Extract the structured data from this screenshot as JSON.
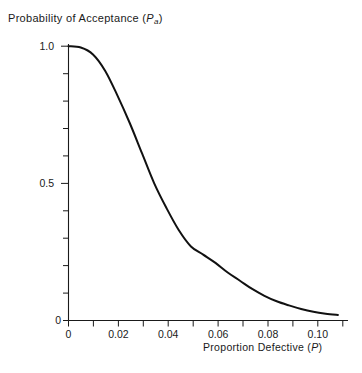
{
  "chart_data": {
    "type": "line",
    "title": "Probability of Acceptance (Pa)",
    "title_main": "Probability  of  Acceptance  (",
    "title_var": "P",
    "title_sub": "a",
    "title_close": ")",
    "xlabel": "Proportion  Defective  (P)",
    "xlabel_main": "Proportion   Defective  (",
    "xlabel_var": "P",
    "xlabel_close": ")",
    "ylabel": "Probability of Acceptance (Pa)",
    "grid": false,
    "legend": "none",
    "line_color": "#111111",
    "axis_color": "#1a1a1a",
    "background": "#ffffff",
    "xlim": [
      0,
      0.112
    ],
    "ylim": [
      0,
      1.0
    ],
    "x_tick_labels": [
      "0",
      "0.02",
      "0.04",
      "0.06",
      "0.08",
      "0.10"
    ],
    "x_tick_values": [
      0,
      0.02,
      0.04,
      0.06,
      0.08,
      0.1
    ],
    "x_minor_tick_step": 0.01,
    "y_tick_labels": [
      "0",
      "0.5",
      "1.0"
    ],
    "y_tick_values": [
      0,
      0.5,
      1.0
    ],
    "y_minor_tick_step": 0.1,
    "series": [
      {
        "name": "OC curve",
        "x": [
          0,
          0.005,
          0.01,
          0.015,
          0.02,
          0.025,
          0.03,
          0.035,
          0.04,
          0.045,
          0.05,
          0.055,
          0.06,
          0.065,
          0.07,
          0.075,
          0.08,
          0.085,
          0.09,
          0.095,
          0.1,
          0.105,
          0.11
        ],
        "values": [
          1.0,
          0.995,
          0.97,
          0.91,
          0.82,
          0.72,
          0.61,
          0.5,
          0.41,
          0.33,
          0.27,
          0.24,
          0.21,
          0.175,
          0.145,
          0.115,
          0.09,
          0.07,
          0.055,
          0.042,
          0.032,
          0.025,
          0.02
        ]
      }
    ]
  }
}
